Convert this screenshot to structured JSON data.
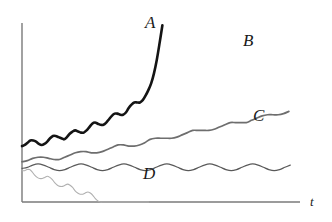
{
  "chart_data": {
    "type": "line",
    "title": "",
    "subtitle": "",
    "xlabel": "t",
    "ylabel": "",
    "grid": false,
    "legend_position": "inline-end-of-curve",
    "axis": {
      "x_axis_label": "t",
      "x_origin_px": 22,
      "y_top_px": 23,
      "x_end_px": 300,
      "y_baseline_px": 202,
      "axis_color": "#7a7a7a",
      "arrowheads": false,
      "ticks": [],
      "tick_labels": []
    },
    "annotations": [
      {
        "text": "A",
        "x_px": 150,
        "y_px": 24
      },
      {
        "text": "B",
        "x_px": 248,
        "y_px": 42
      },
      {
        "text": "C",
        "x_px": 258,
        "y_px": 117
      },
      {
        "text": "D",
        "x_px": 148,
        "y_px": 174
      }
    ],
    "series": [
      {
        "name": "A",
        "label": "A",
        "color": "#141414",
        "line_width": 2.6,
        "description": "Oscillating signal with strong accelerating upward trend, ends in a steep near-vertical rise",
        "x": [
          0,
          2,
          4,
          6,
          8,
          10,
          12,
          14,
          16,
          18,
          20,
          22,
          24,
          26,
          28,
          30,
          32,
          34,
          36,
          38,
          40,
          42,
          44,
          46,
          48,
          50,
          52,
          54,
          56,
          58,
          60,
          62,
          64,
          66,
          68,
          70,
          72,
          74,
          76,
          78,
          80,
          82,
          84,
          86,
          88,
          90,
          92,
          94,
          96,
          98,
          100
        ],
        "y": [
          50,
          51,
          53,
          55,
          55,
          54,
          52,
          51,
          52,
          54,
          57,
          59,
          59,
          58,
          57,
          56,
          58,
          61,
          63,
          64,
          63,
          62,
          62,
          64,
          67,
          70,
          71,
          70,
          69,
          69,
          71,
          74,
          77,
          79,
          79,
          78,
          78,
          80,
          84,
          87,
          89,
          89,
          89,
          91,
          95,
          100,
          106,
          115,
          127,
          142,
          158
        ],
        "ylim": [
          0,
          160
        ]
      },
      {
        "name": "B",
        "label": "B",
        "color": "#6e6e6e",
        "line_width": 1.7,
        "description": "Oscillating signal with steady moderate upward trend, continues to the right edge",
        "x": [
          0,
          2,
          4,
          6,
          8,
          10,
          12,
          14,
          16,
          18,
          20,
          22,
          24,
          26,
          28,
          30,
          32,
          34,
          36,
          38,
          40,
          42,
          44,
          46,
          48,
          50,
          52,
          54,
          56,
          58,
          60,
          62,
          64,
          66,
          68,
          70,
          72,
          74,
          76,
          78,
          80,
          82,
          84,
          86,
          88,
          90,
          92,
          94,
          96,
          98,
          100
        ],
        "y": [
          36,
          37,
          39,
          40,
          40,
          39,
          38,
          38,
          40,
          42,
          44,
          45,
          45,
          44,
          44,
          45,
          47,
          49,
          51,
          51,
          50,
          50,
          51,
          53,
          56,
          57,
          57,
          57,
          57,
          58,
          60,
          62,
          64,
          64,
          64,
          64,
          65,
          67,
          69,
          71,
          71,
          71,
          71,
          73,
          75,
          77,
          78,
          78,
          78,
          79,
          81
        ],
        "ylim": [
          0,
          160
        ]
      },
      {
        "name": "C",
        "label": "C",
        "color": "#595959",
        "line_width": 1.2,
        "description": "Steady periodic oscillation about a flat mean, no trend",
        "x": [
          0,
          2,
          4,
          6,
          8,
          10,
          12,
          14,
          16,
          18,
          20,
          22,
          24,
          26,
          28,
          30,
          32,
          34,
          36,
          38,
          40,
          42,
          44,
          46,
          48,
          50,
          52,
          54,
          56,
          58,
          60,
          62,
          64,
          66,
          68,
          70,
          72,
          74,
          76,
          78,
          80,
          82,
          84,
          86,
          88,
          90,
          92,
          94,
          96,
          98,
          100
        ],
        "y": [
          30,
          31,
          33,
          34,
          33,
          31,
          29,
          28,
          29,
          31,
          33,
          34,
          33,
          31,
          29,
          28,
          29,
          31,
          33,
          34,
          33,
          31,
          29,
          28,
          29,
          31,
          33,
          34,
          33,
          31,
          29,
          28,
          29,
          31,
          33,
          34,
          33,
          31,
          29,
          28,
          29,
          31,
          33,
          34,
          33,
          31,
          29,
          28,
          29,
          31,
          33
        ],
        "ylim": [
          0,
          160
        ]
      },
      {
        "name": "D",
        "label": "D",
        "color": "#b0b0b0",
        "line_width": 1.1,
        "description": "Oscillating signal that decays downward and collapses to zero partway across",
        "x": [
          0,
          2,
          4,
          6,
          8,
          10,
          12,
          14,
          16,
          18,
          20,
          22,
          24,
          26,
          28,
          30,
          32,
          34,
          36,
          38,
          40,
          42,
          44,
          46,
          48,
          50,
          52,
          54,
          56,
          58,
          60,
          62,
          64,
          66,
          68,
          70,
          72,
          74,
          76,
          78,
          80,
          82,
          84,
          86,
          88,
          90,
          92,
          94,
          96,
          98,
          100
        ],
        "y": [
          28,
          28,
          29,
          29,
          27,
          24,
          22,
          21,
          21,
          22,
          23,
          22,
          20,
          17,
          15,
          14,
          14,
          15,
          16,
          15,
          13,
          10,
          8,
          7,
          7,
          8,
          9,
          8,
          6,
          3,
          1,
          0,
          0,
          0,
          0,
          0,
          0,
          0,
          0,
          0,
          0,
          0,
          0,
          0,
          0,
          0,
          0,
          0,
          0,
          0,
          0
        ],
        "ylim": [
          0,
          160
        ]
      }
    ]
  },
  "labels": {
    "a": "A",
    "b": "B",
    "c": "C",
    "d": "D",
    "t": "t"
  }
}
